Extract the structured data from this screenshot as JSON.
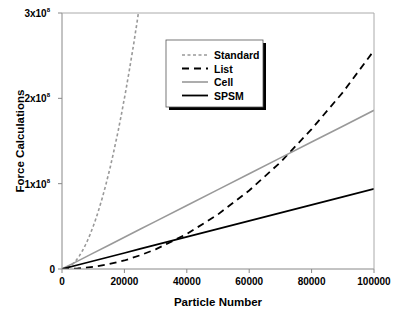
{
  "chart_data": {
    "type": "line",
    "title": "",
    "xlabel": "Particle Number",
    "ylabel": "Force Calculations",
    "xlim": [
      0,
      100000
    ],
    "ylim": [
      0,
      300000000
    ],
    "grid": false,
    "legend_position": "upper-center (inset, boxed with drop shadow)",
    "x_ticks": [
      0,
      20000,
      40000,
      60000,
      80000,
      100000
    ],
    "x_tick_labels": [
      "0",
      "20000",
      "40000",
      "60000",
      "80000",
      "100000"
    ],
    "y_ticks": [
      0,
      100000000,
      200000000,
      300000000
    ],
    "y_tick_labels": [
      {
        "mantissa": "0",
        "exp": ""
      },
      {
        "mantissa": "1x10",
        "exp": "8"
      },
      {
        "mantissa": "2x10",
        "exp": "8"
      },
      {
        "mantissa": "3x10",
        "exp": "8"
      }
    ],
    "x": [
      0,
      5000,
      10000,
      15000,
      20000,
      25000,
      30000,
      40000,
      50000,
      60000,
      70000,
      80000,
      90000,
      100000
    ],
    "series": [
      {
        "name": "Standard",
        "style": "dotted",
        "color": "#999999",
        "values": [
          0,
          12500000,
          50000000,
          112500000,
          200000000,
          300000000,
          null,
          null,
          null,
          null,
          null,
          null,
          null,
          null
        ]
      },
      {
        "name": "List",
        "style": "dashed",
        "color": "#000000",
        "values": [
          0,
          640000,
          2500000,
          5700000,
          10000000,
          16000000,
          23000000,
          41000000,
          64000000,
          92000000,
          125000000,
          164000000,
          207000000,
          256000000
        ]
      },
      {
        "name": "Cell",
        "style": "solid",
        "color": "#999999",
        "values": [
          0,
          9300000,
          18600000,
          27900000,
          37200000,
          46500000,
          55800000,
          74400000,
          93000000,
          111600000,
          130200000,
          148800000,
          167400000,
          186000000
        ]
      },
      {
        "name": "SPSM",
        "style": "solid-thick",
        "color": "#000000",
        "values": [
          0,
          4700000,
          9400000,
          14100000,
          18800000,
          23500000,
          28200000,
          37600000,
          47000000,
          56400000,
          65800000,
          75200000,
          84600000,
          94000000
        ]
      }
    ]
  }
}
